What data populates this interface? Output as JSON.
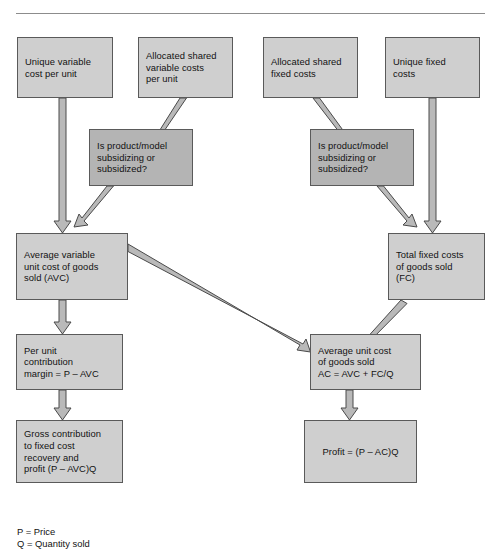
{
  "diagram": {
    "title_rule": "horizontal-divider",
    "colors": {
      "node_light": "#cfcfcf",
      "node_dark": "#b4b4b4",
      "node_border": "#5a5a5a",
      "arrow_fill": "#b9b9b9",
      "arrow_stroke": "#4a4a4a",
      "text": "#121212",
      "background": "#ffffff"
    },
    "nodes": [
      {
        "id": "unique_variable_cost",
        "label": "Unique variable\ncost per unit"
      },
      {
        "id": "allocated_shared_var",
        "label": "Allocated shared\nvariable costs\nper unit"
      },
      {
        "id": "allocated_shared_fixed",
        "label": "Allocated shared\nfixed costs"
      },
      {
        "id": "unique_fixed_costs",
        "label": "Unique fixed\ncosts"
      },
      {
        "id": "decision_left",
        "label": "Is product/model\nsubsidizing or\nsubsidized?"
      },
      {
        "id": "decision_right",
        "label": "Is product/model\nsubsidizing or\nsubsidized?"
      },
      {
        "id": "avc",
        "label": "Average variable\nunit cost of goods\nsold (AVC)"
      },
      {
        "id": "fc",
        "label": "Total fixed costs\nof goods sold\n(FC)"
      },
      {
        "id": "contribution_margin",
        "label": "Per unit\ncontribution\nmargin = P – AVC"
      },
      {
        "id": "average_cost",
        "label": "Average unit cost\nof goods sold\nAC = AVC + FC/Q"
      },
      {
        "id": "gross_contribution",
        "label": "Gross contribution\nto fixed cost\nrecovery and\nprofit (P – AVC)Q"
      },
      {
        "id": "profit",
        "label": "Profit = (P – AC)Q"
      }
    ],
    "edges": [
      {
        "from": "unique_variable_cost",
        "to": "avc"
      },
      {
        "from": "allocated_shared_var",
        "to": "decision_left"
      },
      {
        "from": "decision_left",
        "to": "avc"
      },
      {
        "from": "allocated_shared_fixed",
        "to": "decision_right"
      },
      {
        "from": "decision_right",
        "to": "fc"
      },
      {
        "from": "unique_fixed_costs",
        "to": "fc"
      },
      {
        "from": "avc",
        "to": "contribution_margin"
      },
      {
        "from": "avc",
        "to": "average_cost"
      },
      {
        "from": "fc",
        "to": "average_cost"
      },
      {
        "from": "contribution_margin",
        "to": "gross_contribution"
      },
      {
        "from": "average_cost",
        "to": "profit"
      }
    ],
    "legend": "P = Price\nQ = Quantity sold"
  }
}
